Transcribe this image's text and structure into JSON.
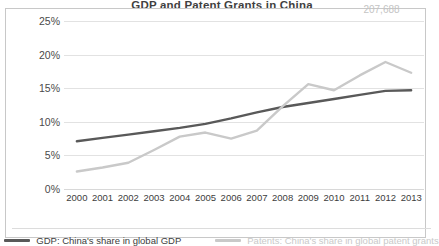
{
  "chart_title": "GDP and Patent Grants in China",
  "point_label": "207,688",
  "legend": {
    "items": [
      {
        "label": "GDP: China's share in global GDP",
        "color": "#595959",
        "key": "gdp"
      },
      {
        "label": "Patents: China's share in global patent grants",
        "color": "#c9c9c9",
        "key": "patents"
      }
    ]
  },
  "chart_data": {
    "type": "line",
    "title": "GDP and Patent Grants in China",
    "xlabel": "",
    "ylabel": "",
    "categories": [
      "2000",
      "2001",
      "2002",
      "2003",
      "2004",
      "2005",
      "2006",
      "2007",
      "2008",
      "2009",
      "2010",
      "2011",
      "2012",
      "2013"
    ],
    "ytick_labels": [
      "0%",
      "5%",
      "10%",
      "15%",
      "20%",
      "25%"
    ],
    "ytick_values": [
      0,
      5,
      10,
      15,
      20,
      25
    ],
    "ylim": [
      0,
      25
    ],
    "grid": true,
    "legend_position": "bottom",
    "annotations": [
      {
        "text": "207,688",
        "series": "Patents: China's share in global patent grants",
        "x": "2012",
        "y": 18.9
      }
    ],
    "series": [
      {
        "name": "GDP: China's share in global GDP",
        "color": "#595959",
        "values": [
          7.1,
          7.6,
          8.1,
          8.6,
          9.1,
          9.7,
          10.5,
          11.4,
          12.2,
          12.8,
          13.4,
          14.0,
          14.6,
          14.7
        ]
      },
      {
        "name": "Patents: China's share in global patent grants",
        "color": "#c9c9c9",
        "values": [
          2.6,
          3.2,
          3.9,
          5.8,
          7.8,
          8.4,
          7.5,
          8.7,
          12.3,
          15.6,
          14.7,
          16.9,
          18.9,
          17.3
        ]
      }
    ]
  }
}
